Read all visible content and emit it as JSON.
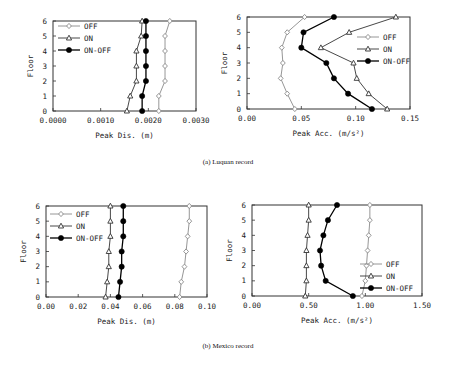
{
  "captions": {
    "a": "(a) Luquan record",
    "b": "(b) Mexico record"
  },
  "colors": {
    "OFF": "#8a8a8a",
    "ON": "#333333",
    "ON-OFF": "#000000"
  },
  "chart_data": [
    {
      "id": "a-dis",
      "type": "line",
      "title": "",
      "xlabel": "Peak Dis. (m)",
      "ylabel": "Floor",
      "xlim": [
        0,
        0.003
      ],
      "ylim": [
        0,
        6
      ],
      "xticks": [
        "0.0000",
        "0.0010",
        "0.0020",
        "0.0030"
      ],
      "yticks": [
        "0",
        "1",
        "2",
        "3",
        "4",
        "5",
        "6"
      ],
      "grid": false,
      "legend_position": "upper-left",
      "y": [
        0,
        1,
        2,
        3,
        4,
        5,
        6
      ],
      "series": [
        {
          "name": "OFF",
          "marker": "diamond-open",
          "values": [
            0.00222,
            0.00222,
            0.00235,
            0.00235,
            0.00235,
            0.00235,
            0.00245
          ]
        },
        {
          "name": "ON",
          "marker": "triangle-open",
          "values": [
            0.00155,
            0.00162,
            0.00175,
            0.00175,
            0.00175,
            0.00185,
            0.00187
          ]
        },
        {
          "name": "ON-OFF",
          "marker": "circle-filled",
          "values": [
            0.00187,
            0.00187,
            0.00195,
            0.00195,
            0.00195,
            0.00195,
            0.00195
          ]
        }
      ]
    },
    {
      "id": "a-acc",
      "type": "line",
      "title": "",
      "xlabel": "Peak Acc. (m/s²)",
      "ylabel": "Floor",
      "xlim": [
        0,
        0.15
      ],
      "ylim": [
        0,
        6
      ],
      "xticks": [
        "0.00",
        "0.05",
        "0.10",
        "0.15"
      ],
      "yticks": [
        "0",
        "1",
        "2",
        "3",
        "4",
        "5",
        "6"
      ],
      "grid": false,
      "legend_position": "right-middle",
      "y": [
        0,
        1,
        2,
        3,
        4,
        5,
        6
      ],
      "series": [
        {
          "name": "OFF",
          "marker": "diamond-open",
          "values": [
            0.044,
            0.037,
            0.031,
            0.033,
            0.032,
            0.037,
            0.053
          ]
        },
        {
          "name": "ON",
          "marker": "triangle-open",
          "values": [
            0.129,
            0.112,
            0.101,
            0.098,
            0.068,
            0.094,
            0.137
          ]
        },
        {
          "name": "ON-OFF",
          "marker": "circle-filled",
          "values": [
            0.115,
            0.093,
            0.08,
            0.073,
            0.05,
            0.052,
            0.08
          ]
        }
      ]
    },
    {
      "id": "b-dis",
      "type": "line",
      "title": "",
      "xlabel": "Peak Dis. (m)",
      "ylabel": "Floor",
      "xlim": [
        0,
        0.1
      ],
      "ylim": [
        0,
        6
      ],
      "xticks": [
        "0.00",
        "0.02",
        "0.04",
        "0.06",
        "0.08",
        "0.10"
      ],
      "yticks": [
        "0",
        "1",
        "2",
        "3",
        "4",
        "5",
        "6"
      ],
      "grid": false,
      "legend_position": "upper-left",
      "y": [
        0,
        1,
        2,
        3,
        4,
        5,
        6
      ],
      "series": [
        {
          "name": "OFF",
          "marker": "diamond-open",
          "values": [
            0.083,
            0.084,
            0.086,
            0.087,
            0.088,
            0.089,
            0.089
          ]
        },
        {
          "name": "ON",
          "marker": "triangle-open",
          "values": [
            0.037,
            0.038,
            0.039,
            0.039,
            0.04,
            0.04,
            0.04
          ]
        },
        {
          "name": "ON-OFF",
          "marker": "circle-filled",
          "values": [
            0.045,
            0.046,
            0.047,
            0.047,
            0.048,
            0.048,
            0.048
          ]
        }
      ]
    },
    {
      "id": "b-acc",
      "type": "line",
      "title": "",
      "xlabel": "Peak Acc. (m/s²)",
      "ylabel": "Floor",
      "xlim": [
        0,
        1.5
      ],
      "ylim": [
        0,
        6
      ],
      "xticks": [
        "0.00",
        "0.50",
        "1.00",
        "1.50"
      ],
      "yticks": [
        "0",
        "1",
        "2",
        "3",
        "4",
        "5",
        "6"
      ],
      "grid": false,
      "legend_position": "lower-right",
      "y": [
        0,
        1,
        2,
        3,
        4,
        5,
        6
      ],
      "series": [
        {
          "name": "OFF",
          "marker": "diamond-open",
          "values": [
            0.97,
            1.0,
            1.01,
            1.02,
            1.03,
            1.04,
            1.04
          ]
        },
        {
          "name": "ON",
          "marker": "triangle-open",
          "values": [
            0.47,
            0.48,
            0.48,
            0.48,
            0.49,
            0.5,
            0.5
          ]
        },
        {
          "name": "ON-OFF",
          "marker": "circle-filled",
          "values": [
            0.89,
            0.65,
            0.61,
            0.6,
            0.63,
            0.67,
            0.75
          ]
        }
      ]
    }
  ],
  "layout": [
    {
      "left": 53,
      "top": 21,
      "right": 196,
      "bottom": 111,
      "legend": {
        "x": 58,
        "y": 26
      }
    },
    {
      "left": 247,
      "top": 17,
      "right": 410,
      "bottom": 109,
      "legend": {
        "x": 357,
        "y": 37
      }
    },
    {
      "left": 46,
      "top": 206,
      "right": 207,
      "bottom": 297,
      "legend": {
        "x": 50,
        "y": 214
      }
    },
    {
      "left": 252,
      "top": 205,
      "right": 422,
      "bottom": 296,
      "legend": {
        "x": 360,
        "y": 264
      }
    }
  ]
}
